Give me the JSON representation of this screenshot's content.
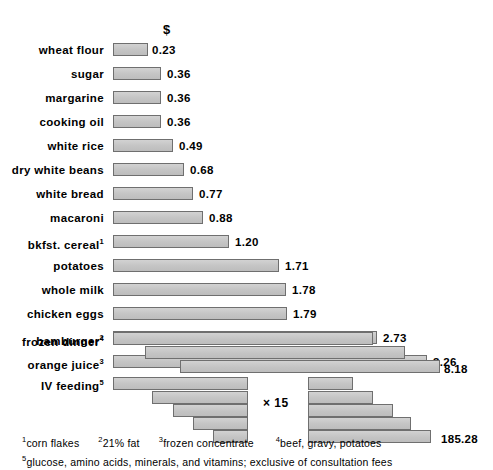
{
  "header": {
    "currency_symbol": "$"
  },
  "chart_data": {
    "type": "bar",
    "title": "",
    "xlabel": "$",
    "ylabel": "",
    "orientation": "horizontal",
    "grid": false,
    "legend": null,
    "axis_scale_px_per_dollar": 96.5,
    "axis_origin_px": 113,
    "xlim": [
      0,
      3.3
    ],
    "note": "Cost per 1000 kcal in dollars; long bars are wrapped across multiple lines; IV feeding value is the left staircase multiplied by 15",
    "categories": [
      "wheat flour",
      "sugar",
      "margarine",
      "cooking oil",
      "white rice",
      "dry white beans",
      "white bread",
      "macaroni",
      "bkfst. cereal",
      "potatoes",
      "whole milk",
      "chicken eggs",
      "hamburger",
      "orange juice",
      "frozen dinner",
      "IV feeding"
    ],
    "values": [
      0.23,
      0.36,
      0.36,
      0.36,
      0.49,
      0.68,
      0.77,
      0.88,
      1.2,
      1.71,
      1.78,
      1.79,
      2.73,
      3.26,
      8.18,
      185.28
    ],
    "value_labels": [
      "0.23",
      "0.36",
      "0.36",
      "0.36",
      "0.49",
      "0.68",
      "0.77",
      "0.88",
      "1.20",
      "1.71",
      "1.78",
      "1.79",
      "2.73",
      "3.26",
      "8.18",
      "185.28"
    ],
    "footnote_markers": [
      "",
      "",
      "",
      "",
      "",
      "",
      "",
      "",
      "1",
      "",
      "",
      "",
      "2",
      "3",
      "4",
      "5"
    ]
  },
  "rows": [
    {
      "label": "wheat flour",
      "sup": "",
      "value": "0.23",
      "bars": [
        {
          "x": 113,
          "w": 35
        }
      ],
      "value_x": 152,
      "type": "simple"
    },
    {
      "label": "sugar",
      "sup": "",
      "value": "0.36",
      "bars": [
        {
          "x": 113,
          "w": 48
        }
      ],
      "value_x": 167,
      "type": "simple"
    },
    {
      "label": "margarine",
      "sup": "",
      "value": "0.36",
      "bars": [
        {
          "x": 113,
          "w": 48
        }
      ],
      "value_x": 167,
      "type": "simple"
    },
    {
      "label": "cooking oil",
      "sup": "",
      "value": "0.36",
      "bars": [
        {
          "x": 113,
          "w": 48
        }
      ],
      "value_x": 167,
      "type": "simple"
    },
    {
      "label": "white rice",
      "sup": "",
      "value": "0.49",
      "bars": [
        {
          "x": 113,
          "w": 60
        }
      ],
      "value_x": 179,
      "type": "simple"
    },
    {
      "label": "dry white beans",
      "sup": "",
      "value": "0.68",
      "bars": [
        {
          "x": 113,
          "w": 71
        }
      ],
      "value_x": 190,
      "type": "simple"
    },
    {
      "label": "white bread",
      "sup": "",
      "value": "0.77",
      "bars": [
        {
          "x": 113,
          "w": 80
        }
      ],
      "value_x": 199,
      "type": "simple"
    },
    {
      "label": "macaroni",
      "sup": "",
      "value": "0.88",
      "bars": [
        {
          "x": 113,
          "w": 90
        }
      ],
      "value_x": 209,
      "type": "simple"
    },
    {
      "label": "bkfst. cereal",
      "sup": "1",
      "value": "1.20",
      "bars": [
        {
          "x": 113,
          "w": 116
        }
      ],
      "value_x": 235,
      "type": "simple"
    },
    {
      "label": "potatoes",
      "sup": "",
      "value": "1.71",
      "bars": [
        {
          "x": 113,
          "w": 166
        }
      ],
      "value_x": 285,
      "type": "simple"
    },
    {
      "label": "whole milk",
      "sup": "",
      "value": "1.78",
      "bars": [
        {
          "x": 113,
          "w": 173
        }
      ],
      "value_x": 292,
      "type": "simple"
    },
    {
      "label": "chicken eggs",
      "sup": "",
      "value": "1.79",
      "bars": [
        {
          "x": 113,
          "w": 174
        }
      ],
      "value_x": 293,
      "type": "simple"
    },
    {
      "label": "hamburger",
      "sup": "2",
      "value": "2.73",
      "bars": [
        {
          "x": 113,
          "w": 264
        }
      ],
      "value_x": 383,
      "type": "simple"
    },
    {
      "label": "orange juice",
      "sup": "3",
      "value": "3.26",
      "bars": [
        {
          "x": 113,
          "w": 314
        }
      ],
      "value_x": 433,
      "type": "simple"
    }
  ],
  "wrapped_rows": [
    {
      "label": "frozen dinner",
      "sup": "4",
      "value": "8.18",
      "bars": [
        {
          "x": 113,
          "y": 332,
          "w": 260
        },
        {
          "x": 145,
          "y": 346,
          "w": 260
        },
        {
          "x": 180,
          "y": 360,
          "w": 260
        }
      ],
      "value_x": 444,
      "value_y": 362
    }
  ],
  "iv_row": {
    "label": "IV feeding",
    "sup": "5",
    "value": "185.28",
    "multiplier": "× 15",
    "multiplier_x": 263,
    "multiplier_y": 396,
    "left_bars": [
      {
        "x": 113,
        "y": 377,
        "w": 135
      },
      {
        "x": 152,
        "y": 391,
        "w": 96
      },
      {
        "x": 173,
        "y": 404,
        "w": 75
      },
      {
        "x": 193,
        "y": 417,
        "w": 55
      },
      {
        "x": 213,
        "y": 430,
        "w": 35
      }
    ],
    "right_bars": [
      {
        "x": 308,
        "y": 377,
        "w": 45
      },
      {
        "x": 308,
        "y": 391,
        "w": 65
      },
      {
        "x": 308,
        "y": 404,
        "w": 85
      },
      {
        "x": 308,
        "y": 417,
        "w": 103
      },
      {
        "x": 308,
        "y": 430,
        "w": 123
      }
    ],
    "value_x": 441,
    "value_y": 432
  },
  "footnotes": [
    {
      "marker": "1",
      "text": "corn flakes"
    },
    {
      "marker": "2",
      "text": "21% fat"
    },
    {
      "marker": "3",
      "text": "frozen concentrate"
    },
    {
      "marker": "4",
      "text": "beef, gravy, potatoes"
    },
    {
      "marker": "5",
      "text": "glucose, amino acids, minerals, and vitamins; exclusive of consultation fees"
    }
  ]
}
